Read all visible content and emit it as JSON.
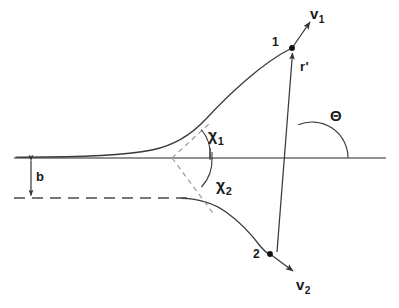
{
  "figure": {
    "type": "diagram",
    "background_color": "#ffffff",
    "line_color": "#444444",
    "text_color": "#1a1a1a",
    "dashed_color": "#8a8a8a"
  },
  "labels": {
    "velocity_1": "v",
    "velocity_1_sub": "1",
    "velocity_2": "v",
    "velocity_2_sub": "2",
    "point_1": "1",
    "point_2": "2",
    "radius_vector": "r'",
    "impact_parameter": "b",
    "theta": "Θ",
    "chi_1": "χ",
    "chi_1_sub": "1",
    "chi_2": "χ",
    "chi_2_sub": "2"
  },
  "geometry": {
    "axis_line": {
      "x1": 14,
      "y1": 158,
      "x2": 386,
      "y2": 158
    },
    "dashed_asymptote_line": {
      "x1": 14,
      "y1": 198,
      "x2": 186,
      "y2": 198
    },
    "scatter_center": {
      "x": 172,
      "y": 158
    },
    "point_1": {
      "x": 292,
      "y": 48
    },
    "point_2": {
      "x": 270,
      "y": 254
    },
    "r_origin": {
      "x": 277,
      "y": 253
    },
    "theta_vertex": {
      "x": 312,
      "y": 158
    },
    "theta_arc_radius": 36,
    "chi1_arc_radius": 38,
    "chi2_arc_radius": 40,
    "impact_parameter_arrow": {
      "x": 31,
      "y_top": 158,
      "y_bottom": 198
    },
    "v1_arrow_tip": {
      "x": 311,
      "y": 21
    },
    "v2_arrow_tip": {
      "x": 294,
      "y": 271
    }
  },
  "caption": ""
}
